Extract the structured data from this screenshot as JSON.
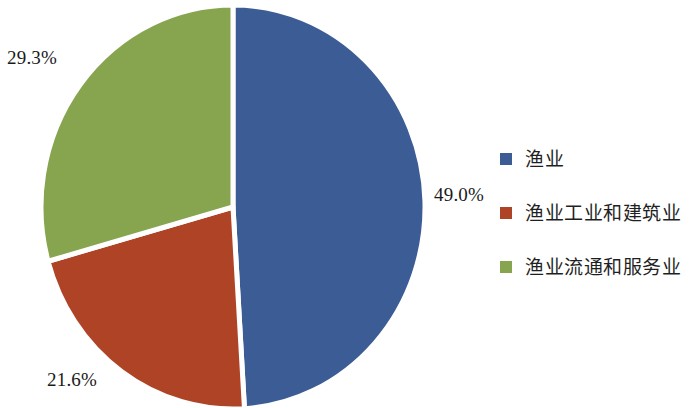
{
  "chart_data": {
    "type": "pie",
    "title": "",
    "subtitle": "",
    "xlabel": "",
    "ylabel": "",
    "grid": false,
    "legend_position": "right",
    "start_angle_deg": 0,
    "direction": "clockwise",
    "categories": [
      "渔业",
      "渔业工业和建筑业",
      "渔业流通和服务业"
    ],
    "values": [
      49.0,
      21.6,
      29.3
    ],
    "value_unit": "%",
    "data_labels": [
      "49.0%",
      "21.6%",
      "29.3%"
    ],
    "colors": [
      "#3C5C96",
      "#AF4326",
      "#87A44E"
    ],
    "slices": [
      {
        "name": "渔业",
        "value": 49.0,
        "label": "49.0%",
        "color": "#3C5C96",
        "start_deg": 0,
        "end_deg": 176.4
      },
      {
        "name": "渔业工业和建筑业",
        "value": 21.6,
        "label": "21.6%",
        "color": "#AF4326",
        "start_deg": 176.4,
        "end_deg": 254.2
      },
      {
        "name": "渔业流通和服务业",
        "value": 29.3,
        "label": "29.3%",
        "color": "#87A44E",
        "start_deg": 254.2,
        "end_deg": 360
      }
    ]
  },
  "labels": {
    "blue_pct": "49.0%",
    "red_pct": "21.6%",
    "green_pct": "29.3%"
  },
  "legend": {
    "items": [
      {
        "label": "渔业",
        "color": "#3C5C96"
      },
      {
        "label": "渔业工业和建筑业",
        "color": "#AF4326"
      },
      {
        "label": "渔业流通和服务业",
        "color": "#87A44E"
      }
    ]
  },
  "style": {
    "background": "#ffffff",
    "separator_color": "#ffffff",
    "text_color": "#1a1a1a"
  }
}
